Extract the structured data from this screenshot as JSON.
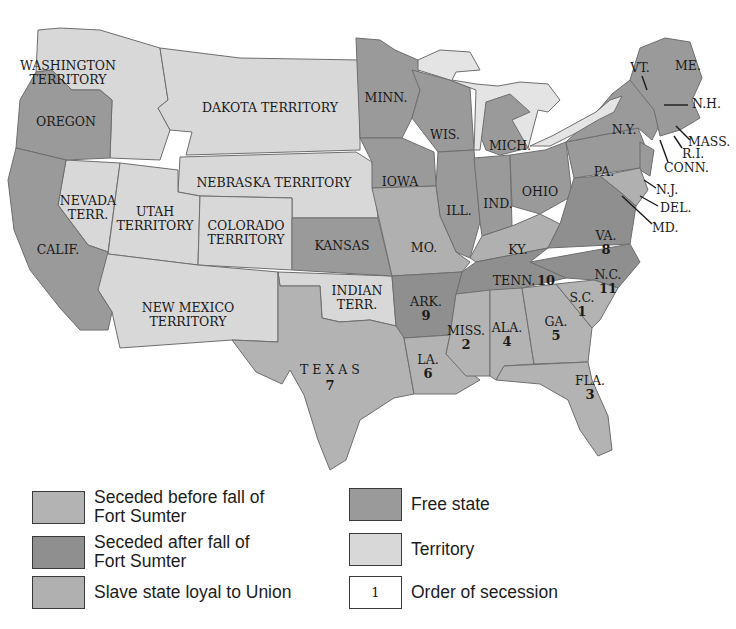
{
  "colors": {
    "seceded_before": "#b3b3b3",
    "seceded_after": "#8f8f8f",
    "slave_loyal": "#b0b0b0",
    "free": "#9a9a9a",
    "territory": "#d8d8d8",
    "order": "#ffffff",
    "water": "#ffffff",
    "lakes": "#e4e4e4"
  },
  "map": {
    "regions": {
      "washington": {
        "label1": "WASHINGTON",
        "label2": "TERRITORY",
        "category": "territory"
      },
      "oregon": {
        "label": "OREGON",
        "category": "free"
      },
      "california": {
        "label": "CALIF.",
        "category": "free"
      },
      "nevada": {
        "label1": "NEVADA",
        "label2": "TERR.",
        "category": "territory"
      },
      "utah": {
        "label1": "UTAH",
        "label2": "TERRITORY",
        "category": "territory"
      },
      "colorado": {
        "label1": "COLORADO",
        "label2": "TERRITORY",
        "category": "territory"
      },
      "dakota": {
        "label": "DAKOTA TERRITORY",
        "category": "territory"
      },
      "nebraska": {
        "label": "NEBRASKA TERRITORY",
        "category": "territory"
      },
      "kansas": {
        "label": "KANSAS",
        "category": "free"
      },
      "new_mexico": {
        "label1": "NEW MEXICO",
        "label2": "TERRITORY",
        "category": "territory"
      },
      "indian": {
        "label1": "INDIAN",
        "label2": "TERR.",
        "category": "territory"
      },
      "texas": {
        "label": "T E X A S",
        "order": "7",
        "category": "seceded_before"
      },
      "minnesota": {
        "label": "MINN.",
        "category": "free"
      },
      "iowa": {
        "label": "IOWA",
        "category": "free"
      },
      "missouri": {
        "label": "MO.",
        "category": "slave_loyal"
      },
      "arkansas": {
        "label": "ARK.",
        "order": "9",
        "category": "seceded_after"
      },
      "louisiana": {
        "label": "LA.",
        "order": "6",
        "category": "seceded_before"
      },
      "wisconsin": {
        "label": "WIS.",
        "category": "free"
      },
      "illinois": {
        "label": "ILL.",
        "category": "free"
      },
      "michigan": {
        "label": "MICH.",
        "category": "free"
      },
      "indiana": {
        "label": "IND.",
        "category": "free"
      },
      "ohio": {
        "label": "OHIO",
        "category": "free"
      },
      "kentucky": {
        "label": "KY.",
        "category": "slave_loyal"
      },
      "tennessee": {
        "label": "TENN.",
        "order": "10",
        "category": "seceded_after"
      },
      "mississippi": {
        "label": "MISS.",
        "order": "2",
        "category": "seceded_before"
      },
      "alabama": {
        "label": "ALA.",
        "order": "4",
        "category": "seceded_before"
      },
      "georgia": {
        "label": "GA.",
        "order": "5",
        "category": "seceded_before"
      },
      "florida": {
        "label": "FLA.",
        "order": "3",
        "category": "seceded_before"
      },
      "south_carolina": {
        "label": "S.C.",
        "order": "1",
        "category": "seceded_before"
      },
      "north_carolina": {
        "label": "N.C.",
        "order": "11",
        "category": "seceded_after"
      },
      "virginia": {
        "label": "VA.",
        "order": "8",
        "category": "seceded_after"
      },
      "pennsylvania": {
        "label": "PA.",
        "category": "free"
      },
      "new_york": {
        "label": "N.Y.",
        "category": "free"
      },
      "vermont": {
        "label": "VT.",
        "category": "free"
      },
      "maine": {
        "label": "ME.",
        "category": "free"
      },
      "new_hampshire": {
        "label": "N.H.",
        "category": "free"
      },
      "massachusetts": {
        "label": "MASS.",
        "category": "free"
      },
      "rhode_island": {
        "label": "R.I.",
        "category": "free"
      },
      "connecticut": {
        "label": "CONN.",
        "category": "free"
      },
      "new_jersey": {
        "label": "N.J.",
        "category": "free"
      },
      "delaware": {
        "label": "DEL.",
        "category": "slave_loyal"
      },
      "maryland": {
        "label": "MD.",
        "category": "slave_loyal"
      }
    }
  },
  "legend": {
    "items": [
      {
        "key": "seceded_before",
        "label": "Seceded before fall of\nFort Sumter"
      },
      {
        "key": "seceded_after",
        "label": "Seceded after fall of\nFort Sumter"
      },
      {
        "key": "slave_loyal",
        "label": "Slave state loyal to Union"
      },
      {
        "key": "free",
        "label": "Free state"
      },
      {
        "key": "territory",
        "label": "Territory"
      },
      {
        "key": "order",
        "label": "Order of secession",
        "swatch_text": "1"
      }
    ]
  }
}
